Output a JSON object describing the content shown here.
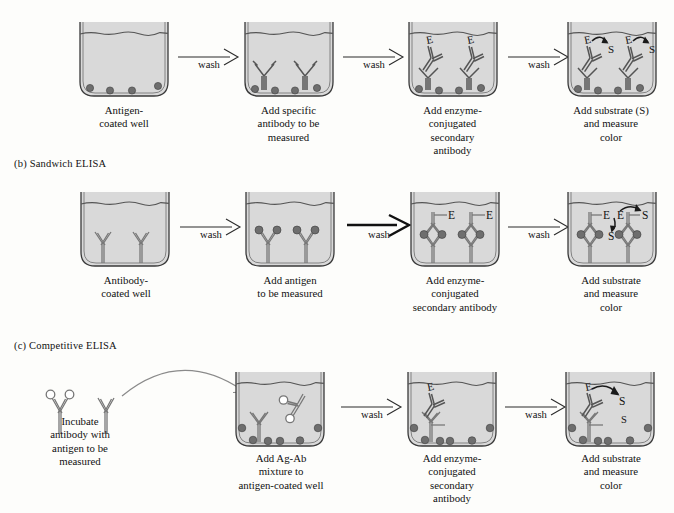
{
  "figure": {
    "title_visible": false,
    "colors": {
      "well_fill": "#d9d9d9",
      "well_outline": "#3a3a3a",
      "antigen_dot": "#6e6e6e",
      "antibody_line": "#4a4a4a",
      "text": "#111111",
      "arrow": "#2b2b2b"
    }
  },
  "sections": [
    {
      "id": "a",
      "label": "",
      "label_visible": false,
      "steps": [
        {
          "caption": [
            "Antigen-",
            "coated well"
          ],
          "well": "antigen-coated-well"
        },
        {
          "caption": [
            "Add specific",
            "antibody to be",
            "measured"
          ],
          "well": "primary-antibody-well"
        },
        {
          "caption": [
            "Add enzyme-",
            "conjugated",
            "secondary",
            "antibody"
          ],
          "well": "enzyme-secondary-antibody-well"
        },
        {
          "caption": [
            "Add substrate (S)",
            "and measure",
            "color"
          ],
          "well": "substrate-color-well"
        }
      ],
      "arrows": [
        {
          "label": "wash",
          "style": "thin"
        },
        {
          "label": "wash",
          "style": "thin"
        },
        {
          "label": "wash",
          "style": "thin"
        }
      ]
    },
    {
      "id": "b",
      "label": "(b) Sandwich ELISA",
      "label_visible": true,
      "steps": [
        {
          "caption": [
            "Antibody-",
            "coated well"
          ],
          "well": "antibody-coated-well"
        },
        {
          "caption": [
            "Add antigen",
            "to be measured"
          ],
          "well": "antigen-captured-well"
        },
        {
          "caption": [
            "Add enzyme-",
            "conjugated",
            "secondary antibody"
          ],
          "well": "sandwich-enzyme-well"
        },
        {
          "caption": [
            "Add substrate",
            "and measure",
            "color"
          ],
          "well": "sandwich-substrate-well"
        }
      ],
      "arrows": [
        {
          "label": "wash",
          "style": "thin"
        },
        {
          "label": "wash",
          "style": "bold"
        },
        {
          "label": "wash",
          "style": "thin"
        }
      ]
    },
    {
      "id": "c",
      "label": "(c) Competitive ELISA",
      "label_visible": true,
      "steps": [
        {
          "caption": [
            "Incubate",
            "antibody with",
            "antigen to be",
            "measured"
          ],
          "well": "free-antibody-antigen-mixture"
        },
        {
          "caption": [
            "Add Ag-Ab",
            "mixture to",
            "antigen-coated well"
          ],
          "well": "competitive-mixture-well"
        },
        {
          "caption": [
            "Add enzyme-",
            "conjugated",
            "secondary",
            "antibody"
          ],
          "well": "competitive-enzyme-well"
        },
        {
          "caption": [
            "Add substrate",
            "and measure",
            "color"
          ],
          "well": "competitive-substrate-well"
        }
      ],
      "arrows": [
        {
          "label": "wash",
          "style": "thin"
        },
        {
          "label": "wash",
          "style": "thin"
        }
      ]
    }
  ],
  "molecule_labels": {
    "enzyme": "E",
    "substrate": "S"
  }
}
